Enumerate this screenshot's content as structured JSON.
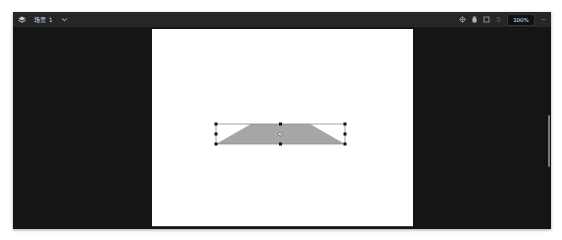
{
  "toolbar": {
    "app_icon": "cube-stack-icon",
    "scene_name": "场景 1",
    "scene_dropdown_icon": "chevron-down-icon",
    "right_icons": [
      "crosshair-icon",
      "hand-icon",
      "frame-icon",
      "zoom-stepper-icon"
    ],
    "zoom_level": "100%",
    "more_icon": "ellipsis-icon"
  },
  "canvas": {
    "background": "#ffffff",
    "shape": {
      "type": "trapezoid",
      "fill": "#a6a6a6",
      "selected": true
    }
  },
  "colors": {
    "window_bg": "#161616",
    "toolbar_bg": "#262626",
    "handle": "#111111",
    "selection_border": "#8a8a8a"
  }
}
